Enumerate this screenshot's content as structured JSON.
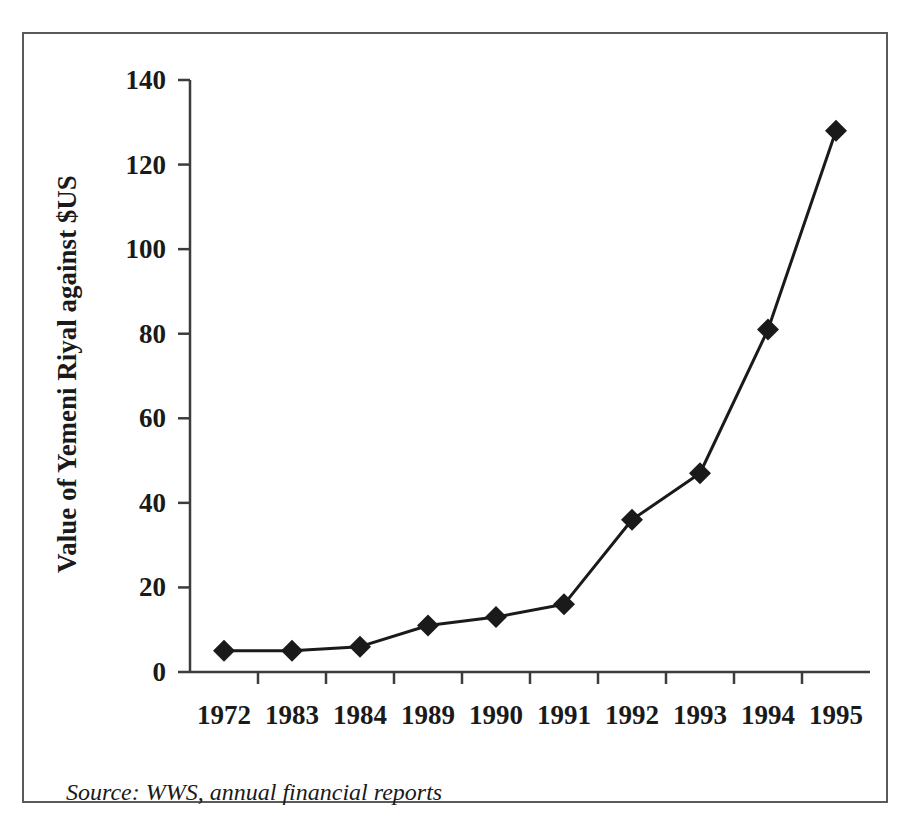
{
  "figure": {
    "source_note": "Source: WWS, annual financial reports",
    "frame_color": "#5a5a5a",
    "background_color": "#ffffff",
    "ink_color": "#1a1a1a"
  },
  "chart_data": {
    "type": "line",
    "title": "",
    "xlabel": "",
    "ylabel": "Value of Yemeni Riyal against $US",
    "categories": [
      "1972",
      "1983",
      "1984",
      "1989",
      "1990",
      "1991",
      "1992",
      "1993",
      "1994",
      "1995"
    ],
    "values": [
      5,
      5,
      6,
      11,
      13,
      16,
      36,
      47,
      81,
      128
    ],
    "series": [
      {
        "name": "Value of Yemeni Riyal against $US",
        "values": [
          5,
          5,
          6,
          11,
          13,
          16,
          36,
          47,
          81,
          128
        ],
        "marker": "diamond",
        "marker_color": "#1a1a1a",
        "line_color": "#1a1a1a"
      }
    ],
    "ylim": [
      0,
      140
    ],
    "yticks": [
      0,
      20,
      40,
      60,
      80,
      100,
      120,
      140
    ],
    "ytick_labels": [
      "0",
      "20",
      "40",
      "60",
      "80",
      "100",
      "120",
      "140"
    ],
    "grid": false,
    "legend": false,
    "legend_position": "none"
  }
}
